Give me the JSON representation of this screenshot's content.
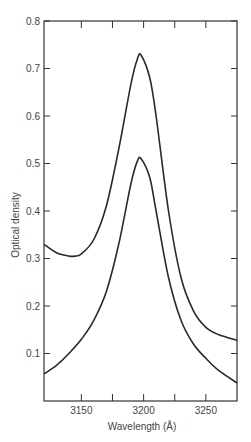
{
  "chart_data": {
    "type": "line",
    "title": "",
    "xlabel": "Wavelength (Å)",
    "ylabel": "Optical density",
    "xlim": [
      3120,
      3275
    ],
    "ylim": [
      0,
      0.8
    ],
    "grid": false,
    "legend": null,
    "x_ticks_labeled": [
      "3150",
      "3200",
      "3250"
    ],
    "x_ticks_minor": [
      3175,
      3225
    ],
    "y_ticks": [
      "0.1",
      "0.2",
      "0.3",
      "0.4",
      "0.5",
      "0.6",
      "0.7",
      "0.8"
    ],
    "series": [
      {
        "name": "upper curve",
        "x": [
          3120,
          3130,
          3140,
          3145,
          3150,
          3160,
          3170,
          3180,
          3190,
          3195,
          3198,
          3205,
          3210,
          3220,
          3230,
          3240,
          3250,
          3260,
          3275
        ],
        "y": [
          0.33,
          0.312,
          0.305,
          0.305,
          0.31,
          0.34,
          0.41,
          0.53,
          0.67,
          0.72,
          0.728,
          0.68,
          0.6,
          0.4,
          0.26,
          0.19,
          0.155,
          0.14,
          0.128
        ]
      },
      {
        "name": "lower curve",
        "x": [
          3120,
          3130,
          3140,
          3150,
          3160,
          3170,
          3180,
          3190,
          3195,
          3198,
          3205,
          3210,
          3220,
          3230,
          3240,
          3250,
          3260,
          3275
        ],
        "y": [
          0.057,
          0.075,
          0.1,
          0.13,
          0.17,
          0.23,
          0.33,
          0.46,
          0.505,
          0.51,
          0.47,
          0.4,
          0.26,
          0.17,
          0.12,
          0.09,
          0.065,
          0.038
        ]
      }
    ]
  }
}
